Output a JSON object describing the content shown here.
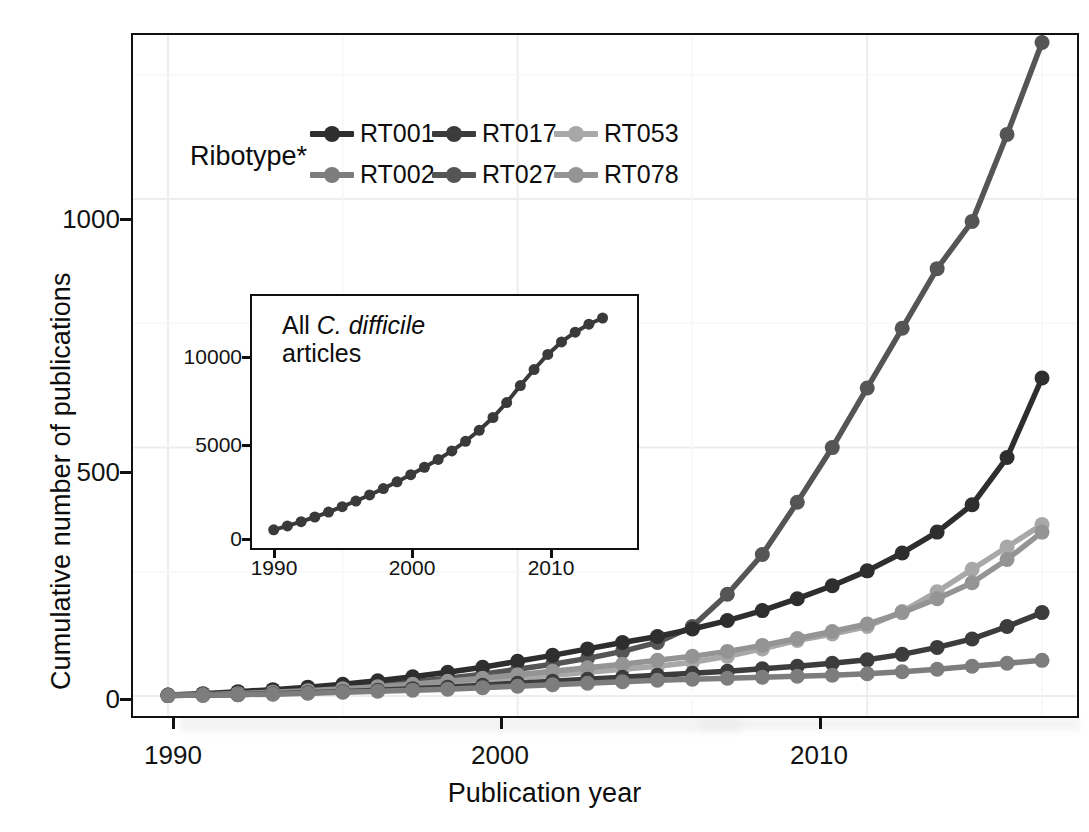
{
  "figure": {
    "background": "#ffffff",
    "panel_border": "#111111"
  },
  "axes": {
    "xlabel": "Publication year",
    "ylabel": "Cumulative number of publications",
    "xticks": [
      "1990",
      "2000",
      "2010"
    ],
    "yticks": [
      "0",
      "500",
      "1000"
    ]
  },
  "legend": {
    "title": "Ribotype*",
    "entries": [
      {
        "label": "RT001",
        "color": "#2e2e2e"
      },
      {
        "label": "RT002",
        "color": "#7d7d7d"
      },
      {
        "label": "RT017",
        "color": "#3c3c3c"
      },
      {
        "label": "RT027",
        "color": "#555555"
      },
      {
        "label": "RT053",
        "color": "#a8a8a8"
      },
      {
        "label": "RT078",
        "color": "#949494"
      }
    ]
  },
  "inset": {
    "note_line1_prefix": "All ",
    "note_line1_italic": "C. difficile",
    "note_line2": "articles",
    "xticks": [
      "1990",
      "2000",
      "2010"
    ],
    "yticks": [
      "0",
      "5000",
      "10000"
    ],
    "border": "#0f0f0f"
  },
  "chart_data": {
    "type": "line",
    "title": "",
    "xlabel": "Publication year",
    "ylabel": "Cumulative number of publications",
    "xlim": [
      1989,
      2016
    ],
    "ylim": [
      -40,
      1330
    ],
    "grid": true,
    "legend_position": "top-left-inside",
    "x": [
      1990,
      1991,
      1992,
      1993,
      1994,
      1995,
      1996,
      1997,
      1998,
      1999,
      2000,
      2001,
      2002,
      2003,
      2004,
      2005,
      2006,
      2007,
      2008,
      2009,
      2010,
      2011,
      2012,
      2013,
      2014,
      2015
    ],
    "series": [
      {
        "name": "RT027",
        "color": "#555555",
        "values": [
          2,
          4,
          7,
          10,
          14,
          18,
          23,
          29,
          36,
          44,
          54,
          64,
          76,
          90,
          108,
          140,
          205,
          285,
          390,
          500,
          620,
          740,
          860,
          955,
          1130,
          1315
        ]
      },
      {
        "name": "RT001",
        "color": "#2e2e2e",
        "values": [
          2,
          5,
          9,
          13,
          18,
          24,
          31,
          39,
          48,
          58,
          70,
          82,
          95,
          108,
          120,
          135,
          152,
          172,
          196,
          222,
          252,
          288,
          330,
          385,
          480,
          640
        ]
      },
      {
        "name": "RT053",
        "color": "#a8a8a8",
        "values": [
          1,
          2,
          4,
          6,
          9,
          12,
          16,
          20,
          25,
          30,
          36,
          42,
          48,
          54,
          60,
          68,
          80,
          95,
          112,
          125,
          140,
          170,
          210,
          255,
          300,
          345
        ]
      },
      {
        "name": "RT078",
        "color": "#949494",
        "values": [
          1,
          3,
          5,
          8,
          11,
          15,
          19,
          24,
          30,
          36,
          43,
          50,
          57,
          64,
          72,
          80,
          90,
          102,
          116,
          130,
          145,
          168,
          196,
          228,
          275,
          330
        ]
      },
      {
        "name": "RT017",
        "color": "#3c3c3c",
        "values": [
          1,
          2,
          3,
          5,
          7,
          9,
          12,
          15,
          18,
          22,
          26,
          30,
          34,
          38,
          42,
          46,
          50,
          55,
          60,
          66,
          73,
          84,
          98,
          115,
          140,
          168
        ]
      },
      {
        "name": "RT002",
        "color": "#7d7d7d",
        "values": [
          1,
          2,
          3,
          4,
          6,
          8,
          10,
          12,
          14,
          17,
          20,
          23,
          26,
          29,
          32,
          34,
          36,
          38,
          40,
          42,
          45,
          49,
          54,
          60,
          66,
          72
        ]
      }
    ],
    "inset": {
      "type": "line",
      "name": "All C. difficile articles",
      "color": "#3a3a3a",
      "xlim": [
        1989,
        2016
      ],
      "ylim": [
        0,
        13000
      ],
      "x": [
        1990,
        1991,
        1992,
        1993,
        1994,
        1995,
        1996,
        1997,
        1998,
        1999,
        2000,
        2001,
        2002,
        2003,
        2004,
        2005,
        2006,
        2007,
        2008,
        2009,
        2010,
        2011,
        2012,
        2013,
        2014
      ],
      "values": [
        180,
        400,
        640,
        900,
        1180,
        1480,
        1800,
        2140,
        2500,
        2880,
        3280,
        3700,
        4140,
        4620,
        5160,
        5780,
        6500,
        7340,
        8300,
        9200,
        10050,
        10750,
        11300,
        11750,
        12100
      ]
    }
  }
}
